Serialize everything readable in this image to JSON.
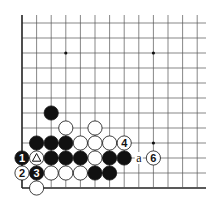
{
  "diagram": {
    "type": "go-board-corner",
    "corner": "bottom-left",
    "columns": 13,
    "rows": 12,
    "star_points": [
      [
        3,
        2
      ],
      [
        9,
        2
      ],
      [
        9,
        8
      ]
    ],
    "stones": [
      {
        "col": 2,
        "row": 6,
        "color": "black",
        "label": ""
      },
      {
        "col": 3,
        "row": 7,
        "color": "white",
        "label": ""
      },
      {
        "col": 5,
        "row": 7,
        "color": "white",
        "label": ""
      },
      {
        "col": 1,
        "row": 8,
        "color": "black",
        "label": ""
      },
      {
        "col": 2,
        "row": 8,
        "color": "black",
        "label": ""
      },
      {
        "col": 3,
        "row": 8,
        "color": "black",
        "label": ""
      },
      {
        "col": 4,
        "row": 8,
        "color": "white",
        "label": ""
      },
      {
        "col": 5,
        "row": 8,
        "color": "white",
        "label": ""
      },
      {
        "col": 6,
        "row": 8,
        "color": "white",
        "label": ""
      },
      {
        "col": 7,
        "row": 8,
        "color": "white",
        "label": "4"
      },
      {
        "col": 0,
        "row": 9,
        "color": "black",
        "label": "1"
      },
      {
        "col": 1,
        "row": 9,
        "color": "white",
        "label": "triangle"
      },
      {
        "col": 2,
        "row": 9,
        "color": "black",
        "label": ""
      },
      {
        "col": 3,
        "row": 9,
        "color": "black",
        "label": ""
      },
      {
        "col": 4,
        "row": 9,
        "color": "black",
        "label": ""
      },
      {
        "col": 5,
        "row": 9,
        "color": "white",
        "label": ""
      },
      {
        "col": 6,
        "row": 9,
        "color": "black",
        "label": ""
      },
      {
        "col": 7,
        "row": 9,
        "color": "black",
        "label": ""
      },
      {
        "col": 9,
        "row": 9,
        "color": "white",
        "label": "6"
      },
      {
        "col": 0,
        "row": 10,
        "color": "white",
        "label": "2"
      },
      {
        "col": 1,
        "row": 10,
        "color": "black",
        "label": "3"
      },
      {
        "col": 2,
        "row": 10,
        "color": "white",
        "label": ""
      },
      {
        "col": 3,
        "row": 10,
        "color": "white",
        "label": ""
      },
      {
        "col": 4,
        "row": 10,
        "color": "white",
        "label": ""
      },
      {
        "col": 5,
        "row": 10,
        "color": "black",
        "label": ""
      },
      {
        "col": 6,
        "row": 10,
        "color": "black",
        "label": ""
      },
      {
        "col": 1,
        "row": 11,
        "color": "white",
        "label": ""
      }
    ],
    "letters": [
      {
        "col": 8,
        "row": 9,
        "text": "a"
      }
    ],
    "colors": {
      "line": "#555555",
      "edge": "#222222",
      "black_stone": "#111111",
      "white_stone": "#ffffff",
      "background": "#ffffff"
    }
  }
}
